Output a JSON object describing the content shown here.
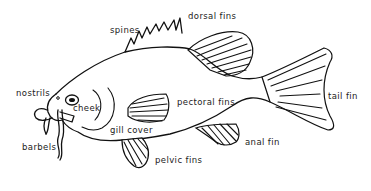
{
  "diagram": {
    "labels": {
      "spines": "spines",
      "dorsal_fins": "dorsal fins",
      "nostrils": "nostrils",
      "cheek": "cheek",
      "pectoral_fins": "pectoral fins",
      "tail_fin": "tail fin",
      "gill_cover": "gill cover",
      "barbels": "barbels",
      "anal_fin": "anal fin",
      "pelvic_fins": "pelvic fins"
    },
    "colors": {
      "line": "#111111",
      "text": "#222222",
      "background": "#ffffff"
    }
  }
}
